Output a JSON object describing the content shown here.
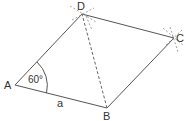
{
  "diagram": {
    "type": "rhombus-construction",
    "points": {
      "A": {
        "label": "A",
        "x": 15,
        "y": 85
      },
      "B": {
        "label": "B",
        "x": 107,
        "y": 108
      },
      "C": {
        "label": "C",
        "x": 174,
        "y": 38
      },
      "D": {
        "label": "D",
        "x": 82,
        "y": 14
      }
    },
    "angle_label": "60°",
    "side_label": "a",
    "stroke_color": "#555555",
    "text_color": "#333333"
  }
}
